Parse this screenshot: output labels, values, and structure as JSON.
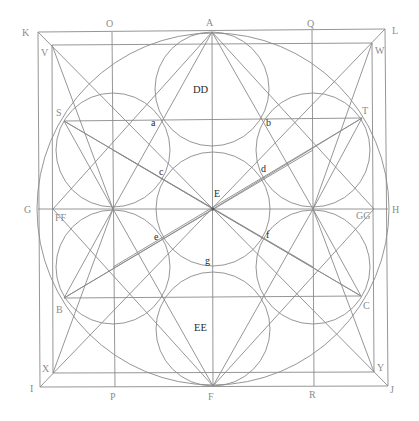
{
  "diagram": {
    "title": "",
    "colors": {
      "line": "#8a8a8a",
      "label_outer": "#8c8c8c",
      "label_inner": "#2a2a2a",
      "background": "#ffffff"
    },
    "points": {
      "K": {
        "label": "K",
        "x": 38,
        "y": 32
      },
      "L": {
        "label": "L",
        "x": 385,
        "y": 29
      },
      "I": {
        "label": "I",
        "x": 40,
        "y": 387
      },
      "J": {
        "label": "J",
        "x": 388,
        "y": 386
      },
      "V": {
        "label": "V",
        "x": 52,
        "y": 45
      },
      "W": {
        "label": "W",
        "x": 372,
        "y": 43
      },
      "X": {
        "label": "X",
        "x": 53,
        "y": 373
      },
      "Y": {
        "label": "Y",
        "x": 374,
        "y": 372
      },
      "A": {
        "label": "A",
        "x": 212,
        "y": 32
      },
      "F": {
        "label": "F",
        "x": 213,
        "y": 386
      },
      "G": {
        "label": "G",
        "x": 38,
        "y": 209
      },
      "H": {
        "label": "H",
        "x": 388,
        "y": 209
      },
      "E": {
        "label": "E",
        "x": 213,
        "y": 209
      },
      "O": {
        "label": "O",
        "x": 112,
        "y": 32
      },
      "Q": {
        "label": "Q",
        "x": 312,
        "y": 30
      },
      "P": {
        "label": "P",
        "x": 115,
        "y": 387
      },
      "R": {
        "label": "R",
        "x": 314,
        "y": 386
      },
      "S": {
        "label": "S",
        "x": 64,
        "y": 121
      },
      "T": {
        "label": "T",
        "x": 362,
        "y": 118
      },
      "B": {
        "label": "B",
        "x": 64,
        "y": 298
      },
      "C": {
        "label": "C",
        "x": 361,
        "y": 296
      },
      "FF": {
        "label": "FF",
        "x": 53,
        "y": 209
      },
      "GG": {
        "label": "GG",
        "x": 374,
        "y": 209
      },
      "a": {
        "label": "a",
        "x": 162,
        "y": 120
      },
      "b": {
        "label": "b",
        "x": 262,
        "y": 119
      },
      "c": {
        "label": "c",
        "x": 163,
        "y": 179
      },
      "d": {
        "label": "d",
        "x": 262,
        "y": 178
      },
      "e": {
        "label": "e",
        "x": 163,
        "y": 238
      },
      "f": {
        "label": "f",
        "x": 262,
        "y": 238
      },
      "g": {
        "label": "g",
        "x": 212,
        "y": 259
      }
    },
    "region_labels": {
      "DD": {
        "label": "DD",
        "x": 201,
        "y": 93
      },
      "EE": {
        "label": "EE",
        "x": 200,
        "y": 331
      }
    },
    "circles": {
      "big": {
        "cx": 213,
        "cy": 209,
        "r": 176
      },
      "top": {
        "cx": 212,
        "cy": 89,
        "r": 57
      },
      "bottom": {
        "cx": 213,
        "cy": 329,
        "r": 57
      },
      "upper_left": {
        "cx": 113,
        "cy": 150,
        "r": 57
      },
      "upper_right": {
        "cx": 313,
        "cy": 150,
        "r": 57
      },
      "lower_left": {
        "cx": 113,
        "cy": 267,
        "r": 57
      },
      "lower_right": {
        "cx": 313,
        "cy": 267,
        "r": 57
      },
      "center": {
        "cx": 213,
        "cy": 209,
        "r": 57
      }
    }
  }
}
